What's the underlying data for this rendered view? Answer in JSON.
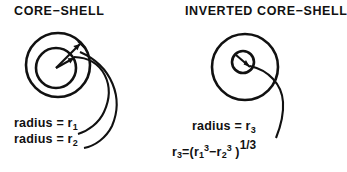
{
  "figure": {
    "background_color": "#ffffff",
    "ink_color": "#111111",
    "panels": [
      {
        "id": "core-shell",
        "title": "CORE−SHELL",
        "labels": [
          {
            "id": "r1",
            "text": "radius = r₁"
          },
          {
            "id": "r2",
            "text": "radius = r₂"
          }
        ],
        "geometry": {
          "outer_circle": {
            "cx": 58,
            "cy": 65,
            "r": 32
          },
          "inner_circle": {
            "cx": 56,
            "cy": 68,
            "r": 20
          }
        }
      },
      {
        "id": "inverted-core-shell",
        "title": "INVERTED CORE−SHELL",
        "labels": [
          {
            "id": "r3",
            "text": "radius = r₃"
          },
          {
            "id": "r3-formula",
            "text": "r₃=(r₁³ −r₂³ )¹ᐟ³"
          }
        ],
        "geometry": {
          "outer_circle": {
            "cx": 245,
            "cy": 67,
            "r": 33
          },
          "inner_circle": {
            "cx": 243,
            "cy": 62,
            "r": 11
          }
        }
      }
    ]
  },
  "text": {
    "title_left": "CORE−SHELL",
    "title_right": "INVERTED CORE−SHELL",
    "radius_word": "radius",
    "equals": "=",
    "r1_label": "radius = r",
    "r1_sub": "1",
    "r2_label": "radius = r",
    "r2_sub": "2",
    "r3_label": "radius = r",
    "r3_sub": "3",
    "formula": {
      "lhs_var": "r",
      "lhs_sub": "3",
      "equals": "=(",
      "term1_var": "r",
      "term1_sub": "1",
      "term1_sup": "3",
      "minus": "−",
      "term2_var": "r",
      "term2_sub": "2",
      "term2_sup": "3",
      "close": " )",
      "exponent": "1/3"
    }
  }
}
